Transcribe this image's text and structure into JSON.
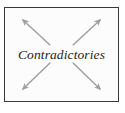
{
  "figure": {
    "width": 125,
    "height": 113,
    "background_color": "#ffffff"
  },
  "diagram": {
    "box": {
      "border_color": "#3a3a3a",
      "fill_color": "#fcfcfc"
    },
    "center_label": "Contradictories",
    "arrow_color": "#9e9e9e",
    "arrows": [
      {
        "name": "arrow-up-left",
        "direction": "up-left",
        "from": {
          "x": 46,
          "y": 38
        },
        "to": {
          "x": 18,
          "y": 12
        }
      },
      {
        "name": "arrow-up-right",
        "direction": "up-right",
        "from": {
          "x": 69,
          "y": 38
        },
        "to": {
          "x": 97,
          "y": 12
        }
      },
      {
        "name": "arrow-down-left",
        "direction": "down-left",
        "from": {
          "x": 46,
          "y": 56
        },
        "to": {
          "x": 18,
          "y": 83
        }
      },
      {
        "name": "arrow-down-right",
        "direction": "down-right",
        "from": {
          "x": 69,
          "y": 56
        },
        "to": {
          "x": 97,
          "y": 83
        }
      }
    ]
  }
}
